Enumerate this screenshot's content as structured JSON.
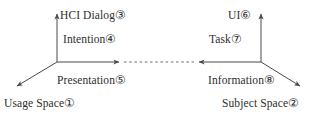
{
  "figure": {
    "background_color": "#ffffff",
    "line_color": "#4a4a4a",
    "text_color": "#2e2e2e"
  },
  "labels": {
    "hci_dialog": "HCI Dialog③",
    "ui": "UI⑥",
    "intention": "Intention④",
    "task": "Task⑦",
    "presentation": "Presentation⑤",
    "information": "Information⑧",
    "usage_space": "Usage Space①",
    "subject_space": "Subject Space②"
  },
  "diagram_data": {
    "type": "diagram",
    "description": "Two mirrored coordinate frames connected by a horizontal double-headed dashed arrow",
    "nodes": [
      {
        "id": 1,
        "label": "Usage Space①",
        "marker": "①",
        "text": "Usage Space",
        "position": "bottom-left",
        "axis": "left-frame diagonal axis end"
      },
      {
        "id": 2,
        "label": "Subject Space②",
        "marker": "②",
        "text": "Subject Space",
        "position": "bottom-right",
        "axis": "right-frame diagonal axis end"
      },
      {
        "id": 3,
        "label": "HCI Dialog③",
        "marker": "③",
        "text": "HCI Dialog",
        "position": "top-left",
        "axis": "left-frame vertical axis end"
      },
      {
        "id": 4,
        "label": "Intention④",
        "marker": "④",
        "text": "Intention",
        "position": "upper-left-inner",
        "axis": "left-frame vertical axis mid"
      },
      {
        "id": 5,
        "label": "Presentation⑤",
        "marker": "⑤",
        "text": "Presentation",
        "position": "lower-left-inner",
        "axis": "left-frame diagonal axis mid"
      },
      {
        "id": 6,
        "label": "UI⑥",
        "marker": "⑥",
        "text": "UI",
        "position": "top-right",
        "axis": "right-frame vertical axis end"
      },
      {
        "id": 7,
        "label": "Task⑦",
        "marker": "⑦",
        "text": "Task",
        "position": "upper-right-inner",
        "axis": "right-frame vertical axis mid"
      },
      {
        "id": 8,
        "label": "Information⑧",
        "marker": "⑧",
        "text": "Information",
        "position": "lower-right-inner",
        "axis": "right-frame diagonal axis mid"
      }
    ],
    "vertices": [
      {
        "id": "left-origin",
        "x": 57,
        "y": 62
      },
      {
        "id": "right-origin",
        "x": 261,
        "y": 62
      }
    ],
    "edges": [
      {
        "id": "left-vertical",
        "from": [
          57,
          62
        ],
        "to": [
          57,
          12
        ],
        "style": "solid",
        "arrow": "end"
      },
      {
        "id": "left-diagonal",
        "from": [
          57,
          62
        ],
        "to": [
          14,
          88
        ],
        "style": "solid",
        "arrow": "end"
      },
      {
        "id": "left-horizontal",
        "from": [
          57,
          62
        ],
        "to": [
          122,
          62
        ],
        "style": "solid",
        "arrow": "end"
      },
      {
        "id": "right-vertical",
        "from": [
          261,
          62
        ],
        "to": [
          261,
          12
        ],
        "style": "solid",
        "arrow": "end"
      },
      {
        "id": "right-diagonal",
        "from": [
          261,
          62
        ],
        "to": [
          303,
          88
        ],
        "style": "solid",
        "arrow": "end"
      },
      {
        "id": "right-horizontal",
        "from": [
          261,
          62
        ],
        "to": [
          196,
          62
        ],
        "style": "solid",
        "arrow": "end"
      },
      {
        "id": "center-link",
        "from": [
          122,
          62
        ],
        "to": [
          196,
          62
        ],
        "style": "dashed",
        "arrow": "none"
      }
    ]
  }
}
